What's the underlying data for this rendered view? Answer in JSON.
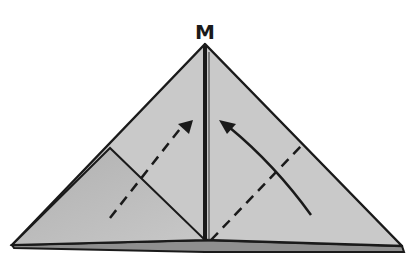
{
  "diagram": {
    "type": "origami-fold-step",
    "point_label": "M",
    "colors": {
      "paper": "#c9c9c9",
      "paper_shadow": "#a8a8a8",
      "outline": "#1a1a1a",
      "background": "#ffffff"
    },
    "annotations": [
      {
        "kind": "valley-fold-line",
        "side": "left",
        "style": "dashed"
      },
      {
        "kind": "valley-fold-line",
        "side": "right",
        "style": "dashed"
      },
      {
        "kind": "fold-arrow",
        "side": "left",
        "direction": "up-right"
      },
      {
        "kind": "fold-arrow",
        "side": "right",
        "direction": "up-left"
      },
      {
        "kind": "center-crease",
        "style": "solid"
      }
    ]
  }
}
